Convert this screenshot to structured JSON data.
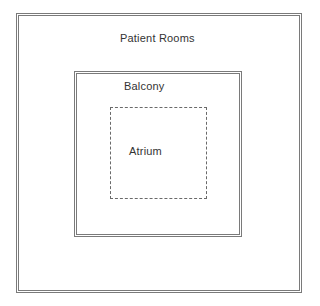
{
  "diagram": {
    "type": "nested-floor-plan",
    "regions": [
      {
        "id": "patient-rooms",
        "label": "Patient Rooms",
        "border": "double"
      },
      {
        "id": "balcony",
        "label": "Balcony",
        "border": "double"
      },
      {
        "id": "atrium",
        "label": "Atrium",
        "border": "dashed"
      }
    ],
    "colors": {
      "line": "#7a7a7a",
      "text": "#333333",
      "background": "#ffffff"
    }
  }
}
